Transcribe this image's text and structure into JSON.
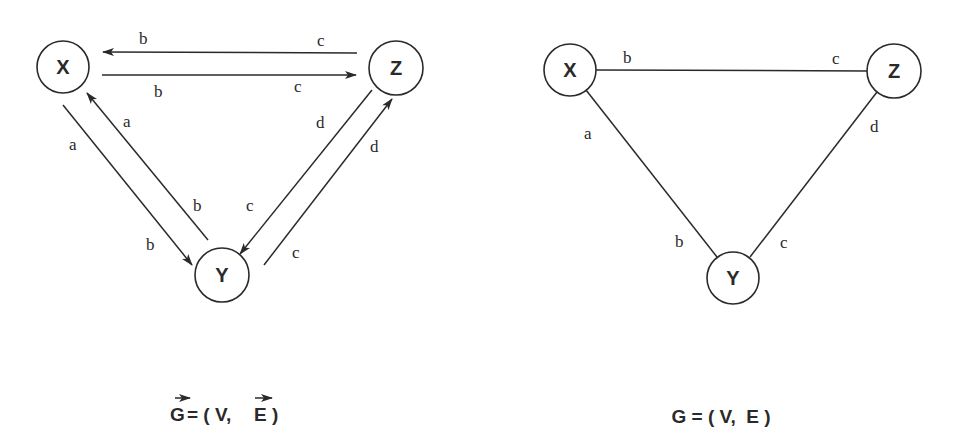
{
  "directed_graph": {
    "caption": {
      "G": "G",
      "rest": "= ( V,",
      "E": "E",
      "close": ")"
    },
    "nodes": [
      {
        "id": "X",
        "label": "X",
        "cx": 63,
        "cy": 67,
        "r": 26
      },
      {
        "id": "Z",
        "label": "Z",
        "cx": 396,
        "cy": 68,
        "r": 27
      },
      {
        "id": "Y",
        "label": "Y",
        "cx": 222,
        "cy": 275,
        "r": 27
      }
    ],
    "edges": [
      {
        "from": "Z",
        "to": "X",
        "start_label": "c",
        "end_label": "b"
      },
      {
        "from": "X",
        "to": "Z",
        "start_label": "b",
        "end_label": "c"
      },
      {
        "from": "X",
        "to": "Y",
        "start_label": "a",
        "end_label": "b"
      },
      {
        "from": "Y",
        "to": "X",
        "start_label": "b",
        "end_label": "a"
      },
      {
        "from": "Z",
        "to": "Y",
        "start_label": "d",
        "end_label": "c"
      },
      {
        "from": "Y",
        "to": "Z",
        "start_label": "c",
        "end_label": "d"
      }
    ],
    "labels": {
      "zx_b": "b",
      "zx_c": "c",
      "xz_b": "b",
      "xz_c": "c",
      "xy_a": "a",
      "xy_b": "b",
      "yx_a": "a",
      "yx_b": "b",
      "zy_d": "d",
      "zy_c": "c",
      "yz_d": "d",
      "yz_c": "c"
    }
  },
  "undirected_graph": {
    "caption": "G = ( V,  E )",
    "nodes": [
      {
        "id": "X",
        "label": "X",
        "cx": 570,
        "cy": 70,
        "r": 26
      },
      {
        "id": "Z",
        "label": "Z",
        "cx": 894,
        "cy": 71,
        "r": 27
      },
      {
        "id": "Y",
        "label": "Y",
        "cx": 733,
        "cy": 278,
        "r": 26
      }
    ],
    "edges": [
      {
        "between": [
          "X",
          "Z"
        ],
        "x_label": "b",
        "z_label": "c"
      },
      {
        "between": [
          "X",
          "Y"
        ],
        "x_label": "a",
        "y_label": "b"
      },
      {
        "between": [
          "Z",
          "Y"
        ],
        "z_label": "d",
        "y_label": "c"
      }
    ],
    "labels": {
      "xz_b": "b",
      "xz_c": "c",
      "xy_a": "a",
      "xy_b": "b",
      "zy_d": "d",
      "zy_c": "c"
    }
  }
}
